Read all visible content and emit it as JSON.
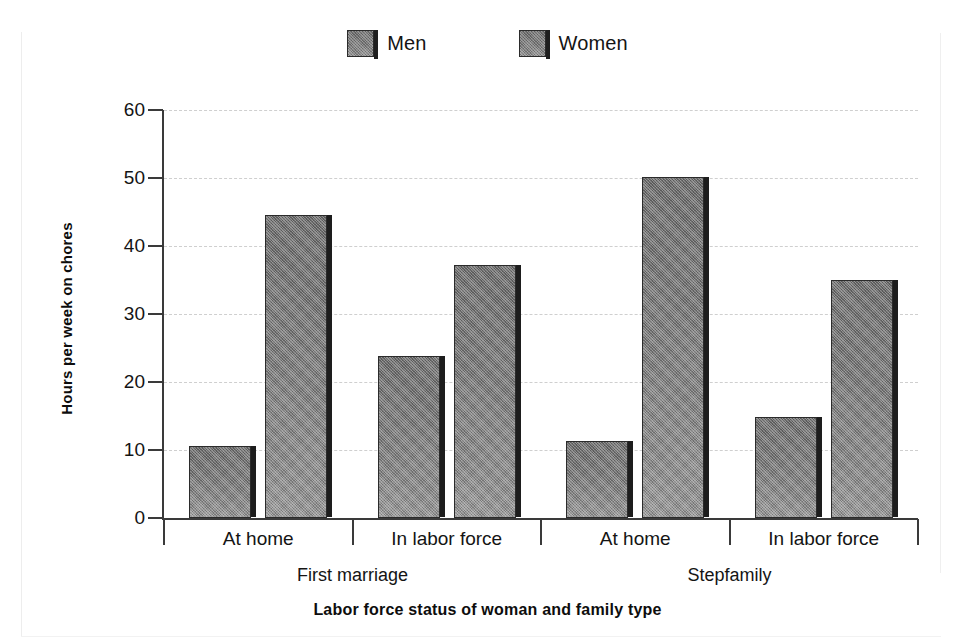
{
  "chart_data": {
    "type": "bar",
    "title": "",
    "xlabel": "Labor force status of woman and family type",
    "ylabel": "Hours per week on chores",
    "ylim": [
      0,
      60
    ],
    "ytick_step": 10,
    "ytick_labels": [
      "60",
      "50",
      "40",
      "30",
      "20",
      "10",
      "0"
    ],
    "ytick_values": [
      60,
      50,
      40,
      30,
      20,
      10,
      0
    ],
    "grid": "horizontal-dashed",
    "legend_position": "top-center",
    "categories": [
      "At home",
      "In labor force",
      "At home",
      "In labor force"
    ],
    "group_labels": [
      "First marriage",
      "Stepfamily"
    ],
    "group_spans": [
      2,
      2
    ],
    "series": [
      {
        "name": "Men",
        "values": [
          10.6,
          23.8,
          11.3,
          14.9
        ]
      },
      {
        "name": "Women",
        "values": [
          44.5,
          37.2,
          50.2,
          35.0
        ]
      }
    ],
    "bar_fill_color": "#7b7b7b",
    "bar_edge_color": "#2b2b2b",
    "bar_shadow_color": "#1d1d1d",
    "gridline_color": "#cfcfcf",
    "axis_color": "#3a3a3a",
    "text_color": "#141414"
  },
  "legend": {
    "items": [
      {
        "label": "Men"
      },
      {
        "label": "Women"
      }
    ]
  },
  "axes": {
    "x_title": "Labor force status of woman and family type",
    "y_title": "Hours per week on chores"
  }
}
